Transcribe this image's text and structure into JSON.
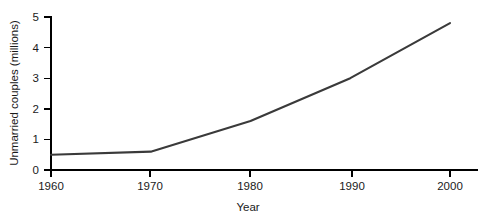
{
  "chart_data": {
    "type": "line",
    "title": "",
    "xlabel": "Year",
    "ylabel": "Unmarried couples (millions)",
    "x": [
      1960,
      1970,
      1980,
      1990,
      2000
    ],
    "categories": [
      "1960",
      "1970",
      "1980",
      "1990",
      "2000"
    ],
    "values": [
      0.5,
      0.6,
      1.6,
      3.0,
      4.8
    ],
    "series": [
      {
        "name": "Unmarried couples",
        "values": [
          0.5,
          0.6,
          1.6,
          3.0,
          4.8
        ],
        "color": "#3a3a3a"
      }
    ],
    "xlim": [
      1960,
      2000
    ],
    "ylim": [
      0,
      5
    ],
    "xticks": [
      1960,
      1970,
      1980,
      1990,
      2000
    ],
    "xtick_labels": [
      "1960",
      "1970",
      "1980",
      "1990",
      "2000"
    ],
    "yticks": [
      0,
      1,
      2,
      3,
      4,
      5
    ],
    "ytick_labels": [
      "0",
      "1",
      "2",
      "3",
      "4",
      "5"
    ],
    "grid": false,
    "legend": false,
    "legend_position": "none",
    "markers": false,
    "annotations": []
  },
  "axes": {
    "y_label_text": "Unmarried couples (millions)",
    "x_label_text": "Year",
    "y_ticks": [
      {
        "label": "5",
        "value": 5
      },
      {
        "label": "4",
        "value": 4
      },
      {
        "label": "3",
        "value": 3
      },
      {
        "label": "2",
        "value": 2
      },
      {
        "label": "1",
        "value": 1
      },
      {
        "label": "0",
        "value": 0
      }
    ],
    "x_ticks": [
      {
        "label": "1960",
        "value": 1960
      },
      {
        "label": "1970",
        "value": 1970
      },
      {
        "label": "1980",
        "value": 1980
      },
      {
        "label": "1990",
        "value": 1990
      },
      {
        "label": "2000",
        "value": 2000
      }
    ]
  },
  "colors": {
    "line": "#3a3a3a",
    "axis": "#000000",
    "text": "#1a1a1a",
    "background": "#ffffff"
  }
}
